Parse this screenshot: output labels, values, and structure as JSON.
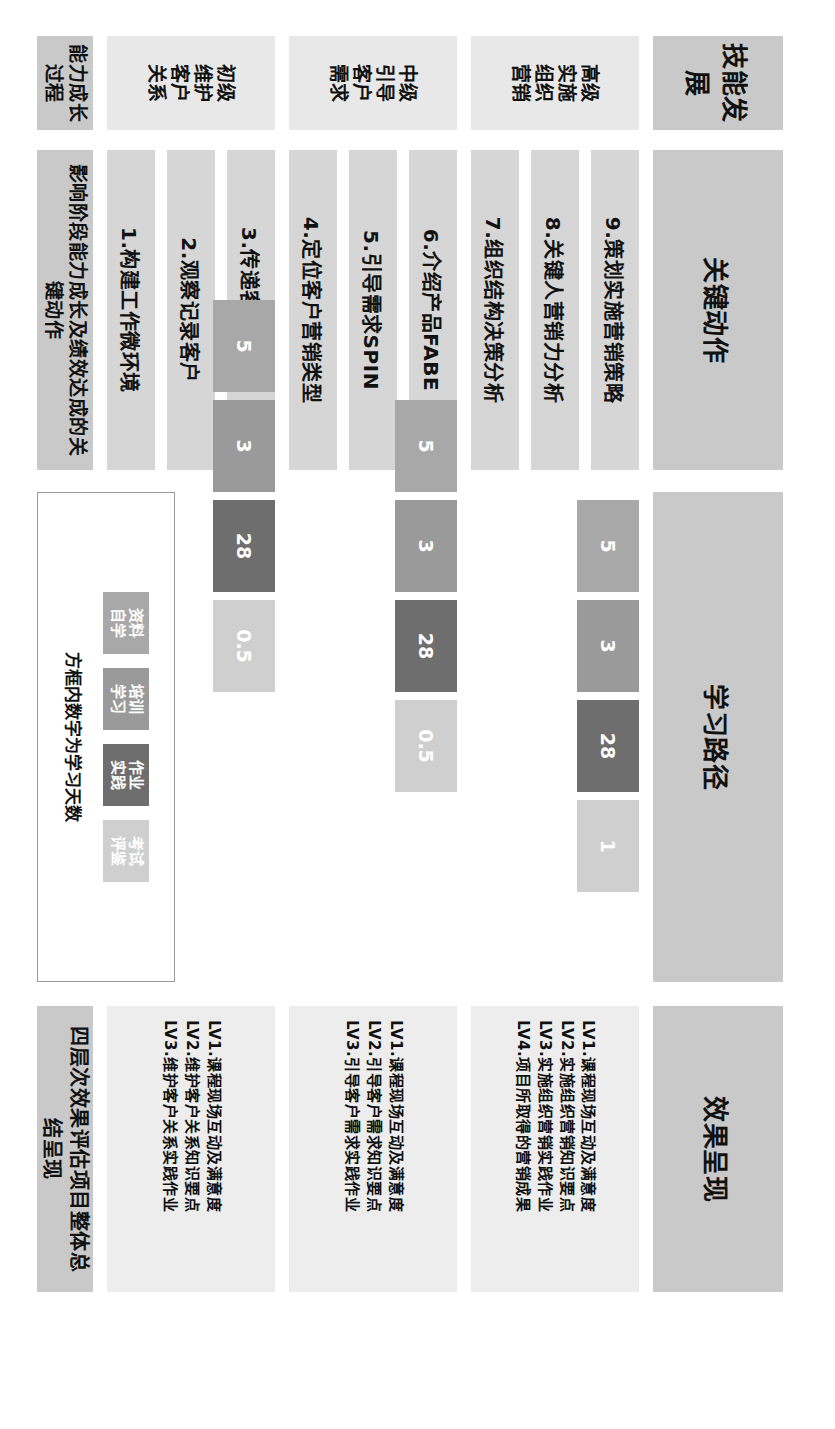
{
  "columns": {
    "skill": "技能发展",
    "actions": "关键动作",
    "path": "学习路径",
    "outcome": "效果呈现",
    "growth_left": "能力成长过程"
  },
  "levels": [
    {
      "id": "advanced",
      "label": "高级\n实施\n组织\n营销"
    },
    {
      "id": "intermediate",
      "label": "中级\n引导\n客户\n需求"
    },
    {
      "id": "basic",
      "label": "初级\n维护\n客户\n关系"
    }
  ],
  "actions": [
    {
      "n": "9",
      "label": "9.策划实施营销策略",
      "level": "advanced"
    },
    {
      "n": "8",
      "label": "8.关键人营销力分析",
      "level": "advanced"
    },
    {
      "n": "7",
      "label": "7.组织结构决策分析",
      "level": "advanced"
    },
    {
      "n": "6",
      "label": "6.介绍产品FABE",
      "level": "intermediate"
    },
    {
      "n": "5",
      "label": "5.引导需求SPIN",
      "level": "intermediate"
    },
    {
      "n": "4",
      "label": "4.定位客户营销类型",
      "level": "intermediate"
    },
    {
      "n": "3",
      "label": "3.传递客户正能量",
      "level": "basic"
    },
    {
      "n": "2",
      "label": "2.观察记录客户",
      "level": "basic"
    },
    {
      "n": "1",
      "label": "1.构建工作微环境",
      "level": "basic"
    }
  ],
  "bottom_summary": "影响阶段能力成长及绩效达成的关键动作",
  "path_blocks": {
    "advanced": [
      {
        "value": "5",
        "kind": "self-study"
      },
      {
        "value": "3",
        "kind": "training"
      },
      {
        "value": "28",
        "kind": "practice"
      },
      {
        "value": "1",
        "kind": "exam"
      }
    ],
    "intermediate": [
      {
        "value": "5",
        "kind": "self-study"
      },
      {
        "value": "3",
        "kind": "training"
      },
      {
        "value": "28",
        "kind": "practice"
      },
      {
        "value": "0.5",
        "kind": "exam"
      }
    ],
    "basic": [
      {
        "value": "5",
        "kind": "self-study"
      },
      {
        "value": "3",
        "kind": "training"
      },
      {
        "value": "28",
        "kind": "practice"
      },
      {
        "value": "0.5",
        "kind": "exam"
      }
    ]
  },
  "legend": {
    "items": [
      {
        "kind": "self-study",
        "label": "资料\n自学",
        "color": "#a8a8a8"
      },
      {
        "kind": "training",
        "label": "培训\n学习",
        "color": "#9a9a9a"
      },
      {
        "kind": "practice",
        "label": "作业\n实践",
        "color": "#6e6e6e"
      },
      {
        "kind": "exam",
        "label": "考试\n评鉴",
        "color": "#cfcfcf"
      }
    ],
    "note": "方框内数字为学习天数"
  },
  "outcomes": [
    {
      "level": "advanced",
      "lines": [
        "LV1.课程现场互动及满意度",
        "LV2.实施组织营销知识要点",
        "LV3.实施组织营销实践作业",
        "LV4.项目所取得的营销成果"
      ]
    },
    {
      "level": "intermediate",
      "lines": [
        "LV1.课程现场互动及满意度",
        "LV2.引导客户需求知识要点",
        "LV3.引导客户需求实践作业"
      ]
    },
    {
      "level": "basic",
      "lines": [
        "LV1.课程现场互动及满意度",
        "LV2.维护客户关系知识要点",
        "LV3.维护客户关系实践作业"
      ]
    }
  ],
  "outcome_summary": "四层次效果评估项目整体总结呈现",
  "colors": {
    "header_gray": "#c9c9c9",
    "level_gray": "#e8e8e8",
    "action_gray": "#d6d6d6",
    "outcome_gray": "#ededed",
    "self_study": "#a8a8a8",
    "training": "#9a9a9a",
    "practice": "#6e6e6e",
    "exam": "#cfcfcf"
  }
}
